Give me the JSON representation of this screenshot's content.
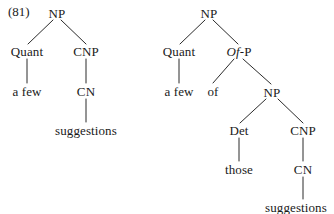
{
  "figure": {
    "example_number": "(81)",
    "background_color": "#ffffff",
    "ink_color": "#2b2b2b",
    "width": 334,
    "height": 214
  },
  "trees": {
    "left": {
      "name": "a few suggestions",
      "nodes": {
        "root_np": "NP",
        "quant": "Quant",
        "cnp": "CNP",
        "a_few": "a few",
        "cn": "CN",
        "suggestions": "suggestions"
      }
    },
    "right": {
      "name": "a few of those suggestions",
      "nodes": {
        "root_np": "NP",
        "quant": "Quant",
        "of_p_italic": "Of",
        "of_p_suffix": "-P",
        "a_few": "a few",
        "of": "of",
        "inner_np": "NP",
        "det": "Det",
        "cnp": "CNP",
        "those": "those",
        "cn": "CN",
        "suggestions": "suggestions"
      }
    }
  }
}
